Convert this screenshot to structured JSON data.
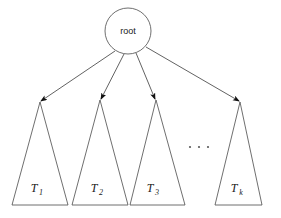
{
  "figure": {
    "title": "",
    "background_color": "#ffffff",
    "stroke_color": "#4a4a4a",
    "text_color": "#1a1a1a"
  },
  "root_node": {
    "label": "root",
    "shape": "circle",
    "cx": 128,
    "cy": 31,
    "r": 23
  },
  "subtrees": [
    {
      "label_base": "T",
      "label_sub": "1",
      "apex_x": 40,
      "apex_y": 102,
      "base_left_x": 12,
      "base_right_x": 68,
      "base_y": 205,
      "label_x": 34,
      "label_y": 192
    },
    {
      "label_base": "T",
      "label_sub": "2",
      "apex_x": 100,
      "apex_y": 100,
      "base_left_x": 72,
      "base_right_x": 128,
      "base_y": 205,
      "label_x": 94,
      "label_y": 192
    },
    {
      "label_base": "T",
      "label_sub": "3",
      "apex_x": 156,
      "apex_y": 100,
      "base_left_x": 130,
      "base_right_x": 185,
      "base_y": 205,
      "label_x": 150,
      "label_y": 192
    },
    {
      "label_base": "T",
      "label_sub": "k",
      "apex_x": 240,
      "apex_y": 102,
      "base_left_x": 215,
      "base_right_x": 262,
      "base_y": 205,
      "label_x": 234,
      "label_y": 192
    }
  ],
  "edges": [
    {
      "from": "root",
      "to": "T1",
      "x1": 115,
      "y1": 51,
      "x2": 41,
      "y2": 101
    },
    {
      "from": "root",
      "to": "T2",
      "x1": 124,
      "y1": 54,
      "x2": 101,
      "y2": 99
    },
    {
      "from": "root",
      "to": "T3",
      "x1": 136,
      "y1": 53,
      "x2": 155,
      "y2": 99
    },
    {
      "from": "root",
      "to": "Tk",
      "x1": 146,
      "y1": 47,
      "x2": 239,
      "y2": 101
    }
  ],
  "ellipsis": {
    "label": "...",
    "dots": [
      {
        "cx": 190,
        "cy": 147
      },
      {
        "cx": 199,
        "cy": 147
      },
      {
        "cx": 208,
        "cy": 147
      }
    ]
  }
}
